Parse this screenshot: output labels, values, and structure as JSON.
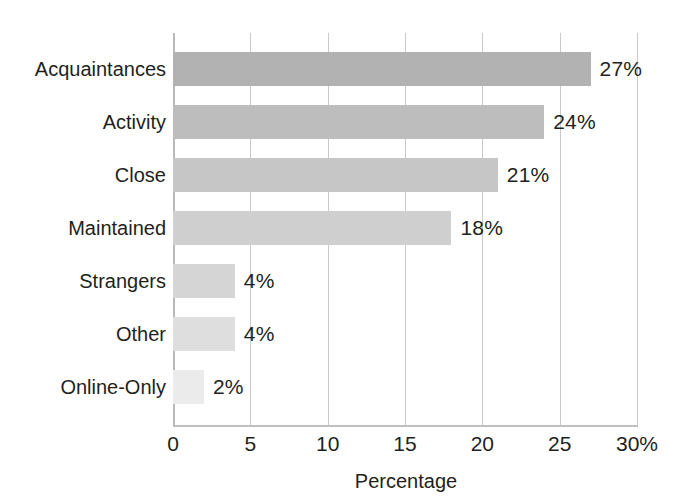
{
  "chart_data": {
    "type": "bar",
    "orientation": "horizontal",
    "title": "",
    "xlabel": "Percentage",
    "ylabel": "",
    "xlim": [
      0,
      30
    ],
    "xticks": [
      0,
      5,
      10,
      15,
      20,
      25,
      30
    ],
    "xtick_labels": [
      "0",
      "5",
      "10",
      "15",
      "20",
      "25",
      "30%"
    ],
    "grid": true,
    "legend": false,
    "categories": [
      "Acquaintances",
      "Activity",
      "Close",
      "Maintained",
      "Strangers",
      "Other",
      "Online-Only"
    ],
    "values": [
      27,
      24,
      21,
      18,
      4,
      4,
      2
    ],
    "value_labels": [
      "27%",
      "24%",
      "21%",
      "18%",
      "4%",
      "4%",
      "2%"
    ],
    "bar_colors": [
      "#b2b2b2",
      "#bdbdbd",
      "#c6c6c6",
      "#cfcfcf",
      "#d5d5d5",
      "#dedede",
      "#ebebeb"
    ]
  },
  "axis": {
    "gridline_color": "#c9c9c9",
    "axis_color": "#bdbdbd",
    "text_color": "#231f20",
    "background": "#ffffff"
  }
}
